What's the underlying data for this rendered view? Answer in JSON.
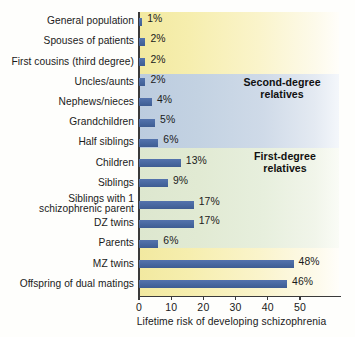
{
  "chart_data": {
    "type": "bar",
    "orientation": "horizontal",
    "title": "",
    "xlabel": "Lifetime risk of developing schizophrenia",
    "ylabel": "",
    "xlim": [
      0,
      55
    ],
    "xticks": [
      0,
      10,
      20,
      30,
      40,
      50
    ],
    "xtick_labels": [
      "0",
      "10",
      "20",
      "30",
      "40",
      "50"
    ],
    "grid": false,
    "legend": null,
    "units": "%",
    "bar_color": "#4a6aa5",
    "categories": [
      "General population",
      "Spouses of patients",
      "First cousins (third degree)",
      "Uncles/aunts",
      "Nephews/nieces",
      "Grandchildren",
      "Half siblings",
      "Children",
      "Siblings",
      "Siblings with 1 schizophrenic parent",
      "DZ twins",
      "Parents",
      "MZ twins",
      "Offspring of dual matings"
    ],
    "values": [
      1,
      2,
      2,
      2,
      4,
      5,
      6,
      13,
      9,
      17,
      17,
      6,
      48,
      46
    ],
    "value_labels": [
      "1%",
      "2%",
      "2%",
      "2%",
      "4%",
      "5%",
      "6%",
      "13%",
      "9%",
      "17%",
      "17%",
      "6%",
      "48%",
      "46%"
    ],
    "annotations": [
      {
        "text": "Second-degree relatives",
        "line1": "Second-degree",
        "line2": "relatives"
      },
      {
        "text": "First-degree relatives",
        "line1": "First-degree",
        "line2": "relatives"
      }
    ],
    "background_bands": [
      {
        "name": "unrelated",
        "color": "#f3eba6"
      },
      {
        "name": "second-degree",
        "color": "#c3d2e2"
      },
      {
        "name": "first-degree",
        "color": "#e1ead3"
      },
      {
        "name": "closest",
        "color": "#f3eba6"
      }
    ]
  },
  "rows": [
    {
      "label": "General population",
      "label2": "",
      "value_label": "1%"
    },
    {
      "label": "Spouses of patients",
      "label2": "",
      "value_label": "2%"
    },
    {
      "label": "First cousins (third degree)",
      "label2": "",
      "value_label": "2%"
    },
    {
      "label": "Uncles/aunts",
      "label2": "",
      "value_label": "2%"
    },
    {
      "label": "Nephews/nieces",
      "label2": "",
      "value_label": "4%"
    },
    {
      "label": "Grandchildren",
      "label2": "",
      "value_label": "5%"
    },
    {
      "label": "Half siblings",
      "label2": "",
      "value_label": "6%"
    },
    {
      "label": "Children",
      "label2": "",
      "value_label": "13%"
    },
    {
      "label": "Siblings",
      "label2": "",
      "value_label": "9%"
    },
    {
      "label": "Siblings with 1",
      "label2": "schizophrenic parent",
      "value_label": "17%"
    },
    {
      "label": "DZ twins",
      "label2": "",
      "value_label": "17%"
    },
    {
      "label": "Parents",
      "label2": "",
      "value_label": "6%"
    },
    {
      "label": "MZ twins",
      "label2": "",
      "value_label": "48%"
    },
    {
      "label": "Offspring of dual matings",
      "label2": "",
      "value_label": "46%"
    }
  ],
  "axis": {
    "title": "Lifetime risk of developing schizophrenia",
    "ticks": [
      "0",
      "10",
      "20",
      "30",
      "40",
      "50"
    ]
  },
  "groups": {
    "second_degree_line1": "Second-degree",
    "second_degree_line2": "relatives",
    "first_degree_line1": "First-degree",
    "first_degree_line2": "relatives"
  }
}
